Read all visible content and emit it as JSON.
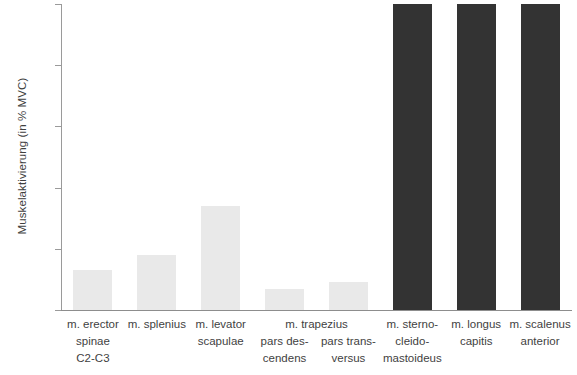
{
  "chart_data": {
    "type": "bar",
    "title": "",
    "subtitle": "",
    "xlabel": "",
    "ylabel": "Muskelaktivierung (in % MVC)",
    "ylim": [
      0,
      100
    ],
    "yticks": [
      0,
      20,
      40,
      60,
      80,
      100
    ],
    "grid": false,
    "legend": "none",
    "categories": [
      "m. erector spinae C2-C3",
      "m. splenius",
      "m. levator scapulae",
      "m. trapezius pars descendens",
      "m. trapezius pars transversus",
      "m. sternocleidomastoideus",
      "m. longus capitis",
      "m. scalenus anterior"
    ],
    "values": [
      13,
      18,
      34,
      7,
      9,
      100,
      100,
      100
    ],
    "colors": {
      "light_bar": "#e9e9e9",
      "dark_bar": "#333333",
      "axis": "#8d8d8d",
      "text": "#3f3f3f"
    },
    "series": [
      {
        "name": "Muskelaktivierung",
        "values": [
          13,
          18,
          34,
          7,
          9,
          100,
          100,
          100
        ]
      }
    ]
  },
  "axis": {
    "y_title": "Muskelaktivierung (in % MVC)",
    "tick_labels": [
      "100",
      "80",
      "60",
      "40",
      "20",
      "0"
    ]
  },
  "bars": [
    {
      "key": "erector-spinae",
      "value": 13,
      "shade": "light",
      "lines": [
        "m. erector",
        "spinae",
        "C2-C3"
      ],
      "group": ""
    },
    {
      "key": "splenius",
      "value": 18,
      "shade": "light",
      "lines": [
        "m. splenius"
      ],
      "group": ""
    },
    {
      "key": "levator-scapulae",
      "value": 34,
      "shade": "light",
      "lines": [
        "m. levator",
        "scapulae"
      ],
      "group": ""
    },
    {
      "key": "trapezius-descendens",
      "value": 7,
      "shade": "light",
      "lines": [
        "pars des-",
        "cendens"
      ],
      "group": "m. trapezius"
    },
    {
      "key": "trapezius-transversus",
      "value": 9,
      "shade": "light",
      "lines": [
        "pars trans-",
        "versus"
      ],
      "group": ""
    },
    {
      "key": "sternocleidomastoideus",
      "value": 100,
      "shade": "dark",
      "lines": [
        "m. sterno-",
        "cleido-",
        "mastoideus"
      ],
      "group": ""
    },
    {
      "key": "longus-capitis",
      "value": 100,
      "shade": "dark",
      "lines": [
        "m. longus",
        "capitis"
      ],
      "group": ""
    },
    {
      "key": "scalenus-anterior",
      "value": 100,
      "shade": "dark",
      "lines": [
        "m. scalenus",
        "anterior"
      ],
      "group": ""
    }
  ],
  "group_labels": [
    {
      "text": "m. trapezius",
      "left_pct": 37.0,
      "width_pct": 30.0
    }
  ],
  "geometry": {
    "bar_left_pct": [
      3.2,
      29.2,
      65.5,
      103.0,
      140.0,
      178.5,
      216.0,
      253.0
    ],
    "note": "positions computed in script from column grid"
  }
}
